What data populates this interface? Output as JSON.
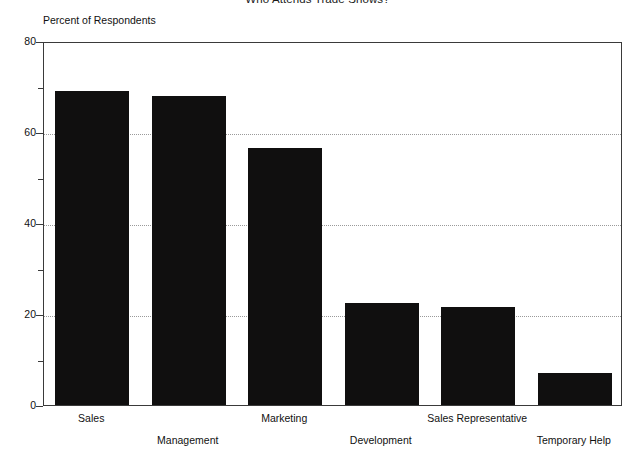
{
  "chart_data": {
    "type": "bar",
    "title": "Who Attends Trade Shows?",
    "xlabel": "",
    "ylabel": "Percent of Respondents",
    "categories": [
      "Sales",
      "Management",
      "Marketing",
      "Development",
      "Sales Representative",
      "Temporary Help"
    ],
    "values": [
      69,
      68,
      56.5,
      22.5,
      21.5,
      7
    ],
    "ylim": [
      0,
      80
    ],
    "y_ticks": [
      0,
      20,
      40,
      60,
      80
    ],
    "y_tick_labels": [
      "0",
      "20",
      "40",
      "60",
      "80"
    ],
    "y_minor_ticks": [
      10,
      30,
      50,
      70
    ],
    "grid": "horizontal-dotted",
    "legend": "none",
    "bar_color": "#100f0f",
    "background_color": "#ffffff",
    "axis_color": "#3a3a3a",
    "gridline_color": "#9a9a9a"
  },
  "axis": {
    "y_title": "Percent of Respondents"
  },
  "labels": {
    "row_a": [
      "Sales",
      "Marketing",
      "Sales Representative"
    ],
    "row_b": [
      "Management",
      "Development",
      "Temporary Help"
    ]
  }
}
